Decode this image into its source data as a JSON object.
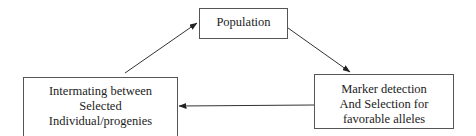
{
  "diagram": {
    "type": "cycle-flowchart",
    "nodes": [
      {
        "id": "population",
        "lines": [
          "Population"
        ]
      },
      {
        "id": "marker",
        "lines": [
          "Marker detection",
          "And Selection for",
          "favorable alleles"
        ]
      },
      {
        "id": "intermating",
        "lines": [
          "Intermating between",
          "Selected",
          "Individual/progenies"
        ]
      }
    ],
    "edges": [
      {
        "from": "population",
        "to": "marker"
      },
      {
        "from": "marker",
        "to": "intermating"
      },
      {
        "from": "intermating",
        "to": "population"
      }
    ],
    "colors": {
      "stroke": "#333333",
      "box_border": "#555555",
      "background": "#ffffff"
    }
  }
}
